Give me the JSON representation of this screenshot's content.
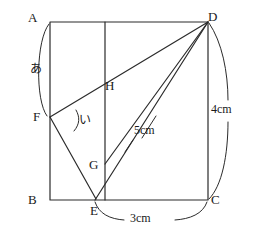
{
  "figure": {
    "stroke_color": "#2b2b2b",
    "background": "#ffffff",
    "vertices": {
      "A": {
        "label": "A",
        "x": 50,
        "y": 22
      },
      "B": {
        "label": "B",
        "x": 50,
        "y": 200
      },
      "C": {
        "label": "C",
        "x": 208,
        "y": 200
      },
      "D": {
        "label": "D",
        "x": 208,
        "y": 22
      },
      "E": {
        "label": "E",
        "x": 95,
        "y": 200
      },
      "F": {
        "label": "F",
        "x": 50,
        "y": 117
      },
      "G": {
        "label": "G",
        "x": 105,
        "y": 164
      },
      "H": {
        "label": "H",
        "x": 105,
        "y": 85
      }
    },
    "angle_marks": [
      {
        "name": "あ",
        "label": "あ",
        "at": "A-to-F on side AB"
      },
      {
        "name": "い",
        "label": "い",
        "at": "angle at F between FD and FG"
      }
    ],
    "measurements": [
      {
        "label": "5cm",
        "segment": "E-D"
      },
      {
        "label": "3cm",
        "segment": "E-C"
      },
      {
        "label": "4cm",
        "segment": "D-C"
      }
    ]
  }
}
